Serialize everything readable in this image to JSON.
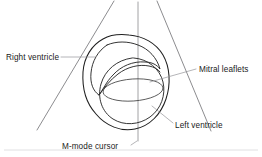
{
  "figure": {
    "type": "anatomical-line-diagram",
    "background_color": "#ffffff",
    "ink_color": "#1f1f1f",
    "guide_color": "#6e6e72",
    "leader_color": "#8d8d92"
  },
  "labels": {
    "right_ventricle": "Right ventricle",
    "mitral_leaflets": "Mitral leaflets",
    "left_ventricle": "Left ventricle",
    "m_mode_cursor": "M-mode cursor"
  },
  "annotations": [
    {
      "id": "right-ventricle",
      "text": "Right ventricle",
      "text_x": 6,
      "text_y": 60,
      "anchor": "start",
      "leader": "M 61,57 L 95,57",
      "points_to": "right ventricular cavity, crescent-shaped chamber at upper left of the heart cross-section"
    },
    {
      "id": "mitral-leaflets",
      "text": "Mitral leaflets",
      "text_x": 199,
      "text_y": 72,
      "anchor": "start",
      "leader": "M 196,69 L 150,82",
      "points_to": "mitral valve orifice, the elliptical opening inside the left ventricular cavity"
    },
    {
      "id": "left-ventricle",
      "text": "Left ventricle",
      "text_x": 175,
      "text_y": 128,
      "anchor": "start",
      "leader": "M 173,123 L 152,106",
      "points_to": "left ventricular cavity, the large rounded chamber"
    },
    {
      "id": "m-mode-cursor",
      "text": "M-mode cursor",
      "text_x": 62,
      "text_y": 149,
      "anchor": "start",
      "leader": "M 131,145 L 137,141",
      "points_to": "vertical scan line crossing the heart through the mitral valve"
    }
  ],
  "geometry": {
    "sector_left": "M 114,1 L 37,130",
    "sector_right": "M 157,1 L 211,131",
    "m_mode_cursor_line": "M 138,2 L 138,141",
    "epicardium": "M 103,39 C 92,45 84,57 83,72 C 82,88 86,103 96,114 C 106,126 121,132 135,129 C 150,126 161,114 166,99 C 171,84 170,67 163,55 C 156,43 143,36 129,35 C 120,34 110,35 103,39 Z",
    "endocardium_rv": "M 107,45 C 98,51 92,61 91,73 C 90,83 93,91 99,95 C 103,90 106,82 113,75 C 121,66 133,61 145,62 C 152,62 157,65 160,69 C 157,58 149,49 138,45 C 128,41 116,41 107,45 Z",
    "rv_free_wall": "M 99,95 C 104,88 110,80 118,74 C 127,67 139,64 149,66 C 154,67 158,69 160,72",
    "lv_endocardium": "M 132,58 C 117,60 105,70 101,84 C 97,98 102,112 113,119 C 124,126 139,125 150,117 C 161,109 166,95 163,82 C 160,69 148,59 134,58 Z",
    "mitral_ellipse": {
      "cx": 133,
      "cy": 90,
      "rx": 30,
      "ry": 11,
      "rotation": -4
    },
    "bottom_rule": "M 4,150 L 258,150"
  },
  "font": {
    "label_size_px": 8.2
  }
}
